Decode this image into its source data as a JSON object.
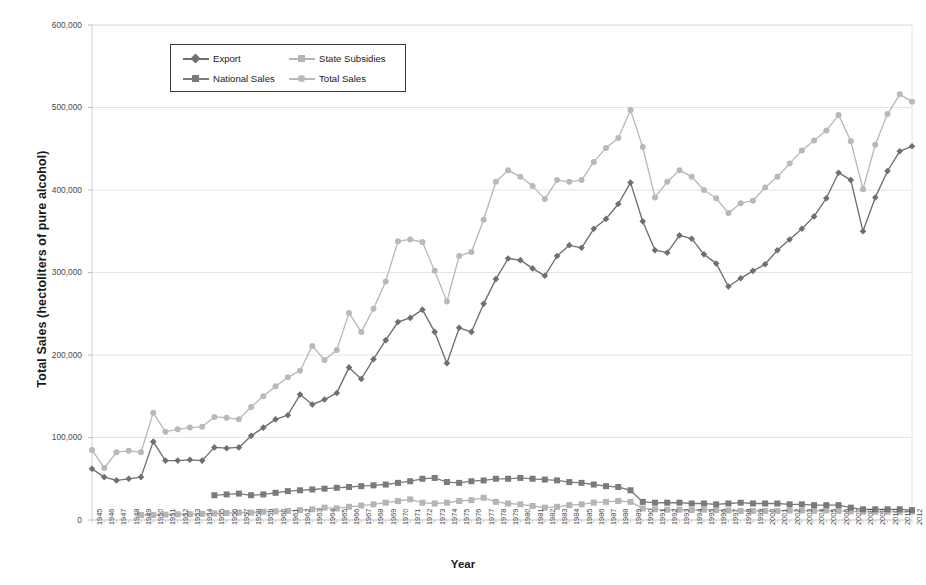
{
  "chart_data": {
    "type": "line",
    "title": "",
    "xlabel": "Year",
    "ylabel": "Total Sales (hectoliters of pure alcohol)",
    "ylim": [
      0,
      600000
    ],
    "yticks": [
      0,
      100000,
      200000,
      300000,
      400000,
      500000,
      600000
    ],
    "ytick_labels": [
      "0",
      "100,000",
      "200,000",
      "300,000",
      "400,000",
      "500,000",
      "600,000"
    ],
    "grid": true,
    "legend_position": "upper-left-inside",
    "x": [
      1945,
      1946,
      1947,
      1948,
      1949,
      1950,
      1951,
      1952,
      1953,
      1954,
      1955,
      1956,
      1957,
      1958,
      1959,
      1960,
      1961,
      1962,
      1963,
      1964,
      1965,
      1966,
      1967,
      1968,
      1969,
      1970,
      1971,
      1972,
      1973,
      1974,
      1975,
      1976,
      1977,
      1978,
      1979,
      1980,
      1981,
      1982,
      1983,
      1984,
      1985,
      1986,
      1987,
      1988,
      1989,
      1990,
      1991,
      1992,
      1993,
      1994,
      1995,
      1996,
      1997,
      1998,
      1999,
      2000,
      2001,
      2002,
      2003,
      2004,
      2005,
      2006,
      2007,
      2008,
      2009,
      2010,
      2011,
      2012
    ],
    "series": [
      {
        "name": "Export",
        "color": "#6f6f6f",
        "marker": "diamond",
        "values": [
          62000,
          52000,
          48000,
          50000,
          52000,
          95000,
          72000,
          72000,
          73000,
          72000,
          88000,
          87000,
          88000,
          102000,
          112000,
          122000,
          127000,
          152000,
          140000,
          146000,
          154000,
          185000,
          171000,
          195000,
          218000,
          240000,
          245000,
          255000,
          228000,
          190000,
          233000,
          228000,
          262000,
          292000,
          317000,
          315000,
          305000,
          296000,
          320000,
          333000,
          330000,
          353000,
          365000,
          383000,
          409000,
          362000,
          327000,
          324000,
          345000,
          341000,
          322000,
          311000,
          283000,
          293000,
          302000,
          310000,
          327000,
          340000,
          353000,
          368000,
          390000,
          421000,
          412000,
          350000,
          391000,
          423000,
          447000,
          453000
        ]
      },
      {
        "name": "State Subsidies",
        "color": "#b5b5b5",
        "marker": "square",
        "values": [
          null,
          null,
          null,
          null,
          6000,
          6000,
          6500,
          7000,
          7000,
          7500,
          8000,
          8500,
          9000,
          9000,
          10000,
          10500,
          11000,
          12000,
          13000,
          15000,
          14000,
          16000,
          17500,
          19000,
          21000,
          23000,
          25000,
          21000,
          20000,
          21000,
          23000,
          24000,
          27000,
          22000,
          20000,
          19000,
          17000,
          15000,
          16000,
          18000,
          19000,
          21000,
          22000,
          23000,
          22000,
          14000,
          13000,
          12500,
          12500,
          12000,
          12500,
          12000,
          11500,
          11000,
          11000,
          11000,
          11000,
          11500,
          11500,
          11000,
          11500,
          11000,
          10500,
          10000,
          10000,
          10000,
          10000,
          10000
        ]
      },
      {
        "name": "National Sales",
        "color": "#7a7a7a",
        "marker": "square",
        "values": [
          null,
          null,
          null,
          null,
          null,
          null,
          null,
          null,
          null,
          null,
          30000,
          31000,
          32000,
          30000,
          31000,
          33000,
          35000,
          36000,
          37000,
          38000,
          39000,
          40000,
          41000,
          42000,
          43000,
          45000,
          47000,
          50000,
          51000,
          46000,
          45000,
          47000,
          48000,
          50000,
          50000,
          51000,
          50000,
          49000,
          48000,
          46000,
          45000,
          43000,
          41000,
          40000,
          36000,
          22000,
          21000,
          21000,
          21000,
          20000,
          20000,
          19000,
          20000,
          21000,
          20000,
          20000,
          20000,
          19000,
          19000,
          18000,
          18000,
          18000,
          15000,
          13000,
          13000,
          13000,
          13000,
          12000
        ]
      },
      {
        "name": "Total Sales",
        "color": "#b9b9b9",
        "marker": "circle",
        "values": [
          85000,
          63000,
          82000,
          84000,
          82000,
          130000,
          107000,
          110000,
          112000,
          113000,
          125000,
          124000,
          122000,
          137000,
          150000,
          162000,
          173000,
          181000,
          211000,
          194000,
          206000,
          251000,
          228000,
          256000,
          289000,
          338000,
          340000,
          337000,
          302000,
          265000,
          320000,
          325000,
          364000,
          410000,
          424000,
          416000,
          405000,
          389000,
          412000,
          410000,
          412000,
          434000,
          451000,
          463000,
          497000,
          452000,
          391000,
          410000,
          424000,
          416000,
          400000,
          390000,
          372000,
          384000,
          387000,
          403000,
          416000,
          432000,
          448000,
          460000,
          472000,
          491000,
          459000,
          401000,
          455000,
          492000,
          516000,
          507000
        ]
      }
    ]
  }
}
